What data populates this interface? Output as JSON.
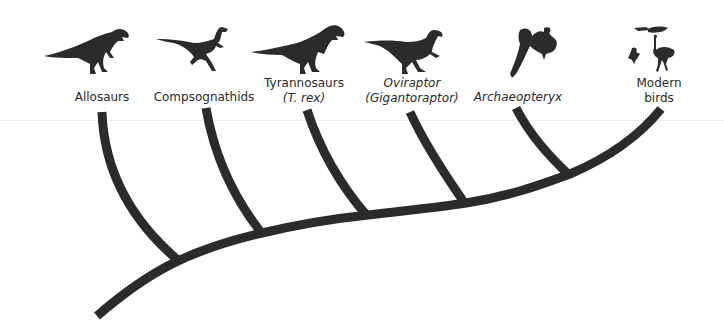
{
  "diagram": {
    "type": "cladogram",
    "branch_color": "#2b2b2b",
    "text_color": "#2a2a2a",
    "taxa": [
      {
        "id": "allosaurs",
        "label": "Allosaurs",
        "sub": null,
        "italic": false,
        "icon": "allosaur-silhouette-icon"
      },
      {
        "id": "compsognathids",
        "label": "Compsognathids",
        "sub": null,
        "italic": false,
        "icon": "compsognathid-silhouette-icon"
      },
      {
        "id": "tyrannosaurs",
        "label": "Tyrannosaurs",
        "sub": "(T. rex)",
        "italic": false,
        "icon": "tyrannosaur-silhouette-icon"
      },
      {
        "id": "oviraptor",
        "label": "Oviraptor",
        "sub": "(Gigantoraptor)",
        "italic": true,
        "icon": "oviraptor-silhouette-icon"
      },
      {
        "id": "archaeopteryx",
        "label": "Archaeopteryx",
        "sub": null,
        "italic": true,
        "icon": "archaeopteryx-silhouette-icon"
      },
      {
        "id": "modern-birds",
        "label": "Modern",
        "sub": "birds",
        "italic": false,
        "icon": "modern-birds-silhouette-icon"
      }
    ]
  }
}
